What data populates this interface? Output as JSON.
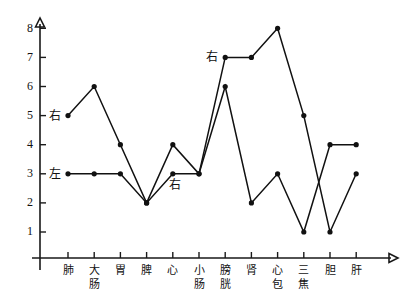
{
  "chart_data": {
    "type": "line",
    "title": "",
    "xlabel": "",
    "ylabel": "",
    "ylim": [
      0,
      8.6
    ],
    "yticks": [
      1,
      2,
      3,
      4,
      5,
      6,
      7,
      8
    ],
    "grid": false,
    "legend_position": "inline-annotations",
    "categories": [
      "肺",
      "大肠",
      "胃",
      "脾",
      "心",
      "小肠",
      "膀胱",
      "肾",
      "心包",
      "三焦",
      "胆",
      "肝"
    ],
    "series": [
      {
        "name": "右",
        "values": [
          5,
          6,
          4,
          2,
          4,
          3,
          7,
          7,
          8,
          5,
          1,
          3
        ]
      },
      {
        "name": "左",
        "values": [
          3,
          3,
          3,
          2,
          3,
          3,
          6,
          2,
          3,
          1,
          4,
          4
        ]
      }
    ],
    "annotations": [
      {
        "text": "右",
        "category": "肺",
        "value": 5,
        "series": "右",
        "placement": "left"
      },
      {
        "text": "左",
        "category": "肺",
        "value": 3,
        "series": "左",
        "placement": "left"
      },
      {
        "text": "右",
        "category": "心",
        "value": 3,
        "series": "左",
        "placement": "below"
      },
      {
        "text": "右",
        "category": "膀胱",
        "value": 7,
        "series": "右",
        "placement": "left"
      }
    ]
  },
  "colors": {
    "line": "#111111",
    "axis": "#1a1a1a",
    "marker": "#111111",
    "background": "#ffffff"
  }
}
